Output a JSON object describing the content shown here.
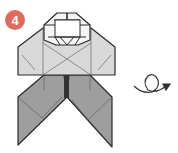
{
  "diagram": {
    "type": "origami-instruction-step",
    "step": {
      "number": "4",
      "badge_color": "#e06a5c"
    },
    "figure": {
      "name": "folded-figure",
      "colors": {
        "light_paper": "#d9d9d9",
        "dark_paper": "#9e9e9e",
        "line": "#2a2a2a",
        "thin_line": "#555555"
      }
    },
    "symbol": {
      "name": "turn-over-arrow",
      "meaning": "turn model over"
    }
  }
}
